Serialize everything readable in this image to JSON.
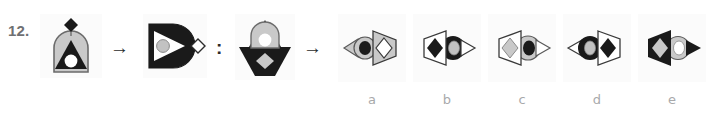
{
  "question": {
    "number": "12.",
    "type": "visual-analogy-matrix"
  },
  "operators": {
    "arrow1": "→",
    "analogy_colon": ":",
    "arrow2": "→"
  },
  "colors": {
    "black": "#1a1a1a",
    "grey": "#c9c9c9",
    "grey_dark": "#b0b0b0",
    "white": "#ffffff",
    "outline": "#3a3a3a",
    "tile_bg": "#fbfbfb",
    "label_grey": "#a8a9ab",
    "number_grey": "#6f7072"
  },
  "stem": {
    "cell_a": {
      "name": "stem-figure-1",
      "description": "grey dome with black triangle containing white circle, black diamond on top",
      "shapes": [
        "dome-grey",
        "triangle-black",
        "circle-white",
        "diamond-black"
      ]
    },
    "cell_b": {
      "name": "stem-figure-2",
      "description": "black D-shape rotated right, white triangle containing grey circle, outlined diamond at right",
      "shapes": [
        "dome-black-rotated",
        "triangle-white",
        "circle-grey",
        "diamond-outline"
      ]
    },
    "cell_c": {
      "name": "stem-figure-3",
      "description": "black inverted shape with grey diamond, grey rounded shape with white circle, black triangle on top",
      "shapes": [
        "dome-black-inverted",
        "diamond-grey",
        "shape-grey",
        "circle-white",
        "triangle-black"
      ]
    }
  },
  "options": [
    {
      "label": "a",
      "name": "option-a",
      "description": "grey circle with black inner circle and small grey triangle left; grey trapezoid with white diamond right",
      "circle_outer": "grey",
      "circle_inner": "black",
      "trapezoid": "grey",
      "diamond": "white",
      "trapezoid_side": "right"
    },
    {
      "label": "b",
      "name": "option-b",
      "description": "white outlined trapezoid with black diamond left; black circle with grey inner circle and white triangle right",
      "circle_outer": "black",
      "circle_inner": "grey",
      "trapezoid": "white",
      "diamond": "black",
      "trapezoid_side": "left"
    },
    {
      "label": "c",
      "name": "option-c",
      "description": "white outlined trapezoid with grey diamond left; grey circle with black inner circle and outlined triangle right",
      "circle_outer": "grey",
      "circle_inner": "black",
      "trapezoid": "white",
      "diamond": "grey",
      "trapezoid_side": "left"
    },
    {
      "label": "d",
      "name": "option-d",
      "description": "black circle with grey inner circle and small triangle left; white outlined trapezoid with black diamond right",
      "circle_outer": "black",
      "circle_inner": "grey",
      "trapezoid": "white",
      "diamond": "black",
      "trapezoid_side": "right"
    },
    {
      "label": "e",
      "name": "option-e",
      "description": "black trapezoid with grey diamond left; grey circle with white inner circle and black triangle right",
      "circle_outer": "grey",
      "circle_inner": "white",
      "trapezoid": "black",
      "diamond": "grey",
      "trapezoid_side": "left"
    }
  ]
}
